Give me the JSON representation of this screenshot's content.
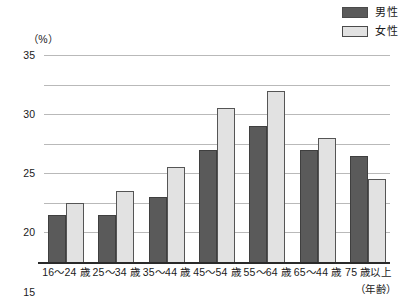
{
  "chart_data": {
    "type": "bar",
    "title": "",
    "xlabel": "（年齢）",
    "ylabel": "（%）",
    "ylim": [
      0,
      35
    ],
    "yticks": [
      0,
      5,
      10,
      15,
      20,
      25,
      30,
      35
    ],
    "grid": true,
    "legend_position": "top-right",
    "categories": [
      "16〜24 歳",
      "25〜34 歳",
      "35〜44 歳",
      "45〜54 歳",
      "55〜64 歳",
      "65〜44 歳",
      "75 歳以上"
    ],
    "series": [
      {
        "name": "男性",
        "color": "#5a5a5a",
        "values": [
          8,
          8,
          11,
          19,
          23,
          19,
          18
        ]
      },
      {
        "name": "女性",
        "color": "#e2e2e2",
        "values": [
          10,
          12,
          16,
          26,
          29,
          21,
          14
        ]
      }
    ]
  },
  "legend": {
    "items": [
      {
        "label": "男性",
        "swatch": "male"
      },
      {
        "label": "女性",
        "swatch": "female"
      }
    ]
  },
  "colors": {
    "male_fill": "#5a5a5a",
    "female_fill": "#e2e2e2",
    "gridline": "#b9b9b9",
    "axis": "#2a2a2a"
  }
}
